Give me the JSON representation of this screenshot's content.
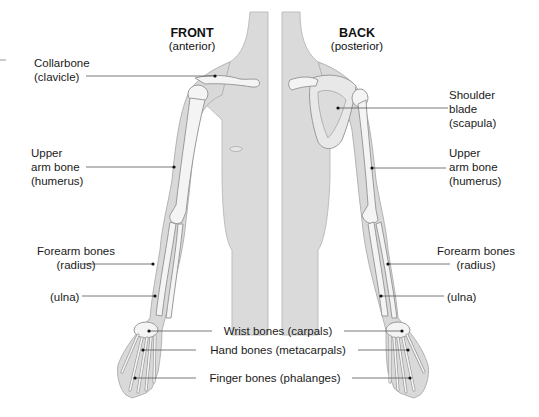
{
  "figure": {
    "type": "anatomical-diagram",
    "colors": {
      "skin": "#d9d9d9",
      "skin_edge": "#b3b3b3",
      "bone": "#f4f4f4",
      "bone_edge": "#9a9a9a",
      "leader_line": "#555555",
      "text": "#1a1a1a",
      "background": "#ffffff"
    }
  },
  "views": {
    "front": {
      "title": "FRONT",
      "subtitle": "(anterior)"
    },
    "back": {
      "title": "BACK",
      "subtitle": "(posterior)"
    }
  },
  "labels": {
    "left": {
      "collarbone": [
        "Collarbone",
        "(clavicle)"
      ],
      "humerus": [
        "Upper",
        "arm bone",
        "(humerus)"
      ],
      "forearm": [
        "Forearm bones",
        "(radius)"
      ],
      "ulna": [
        "(ulna)"
      ]
    },
    "right": {
      "scapula": [
        "Shoulder",
        "blade",
        "(scapula)"
      ],
      "humerus": [
        "Upper",
        "arm bone",
        "(humerus)"
      ],
      "forearm": [
        "Forearm bones",
        "(radius)"
      ],
      "ulna": [
        "(ulna)"
      ]
    },
    "center": {
      "carpals": "Wrist bones (carpals)",
      "metacarpals": "Hand bones (metacarpals)",
      "phalanges": "Finger bones (phalanges)"
    }
  }
}
